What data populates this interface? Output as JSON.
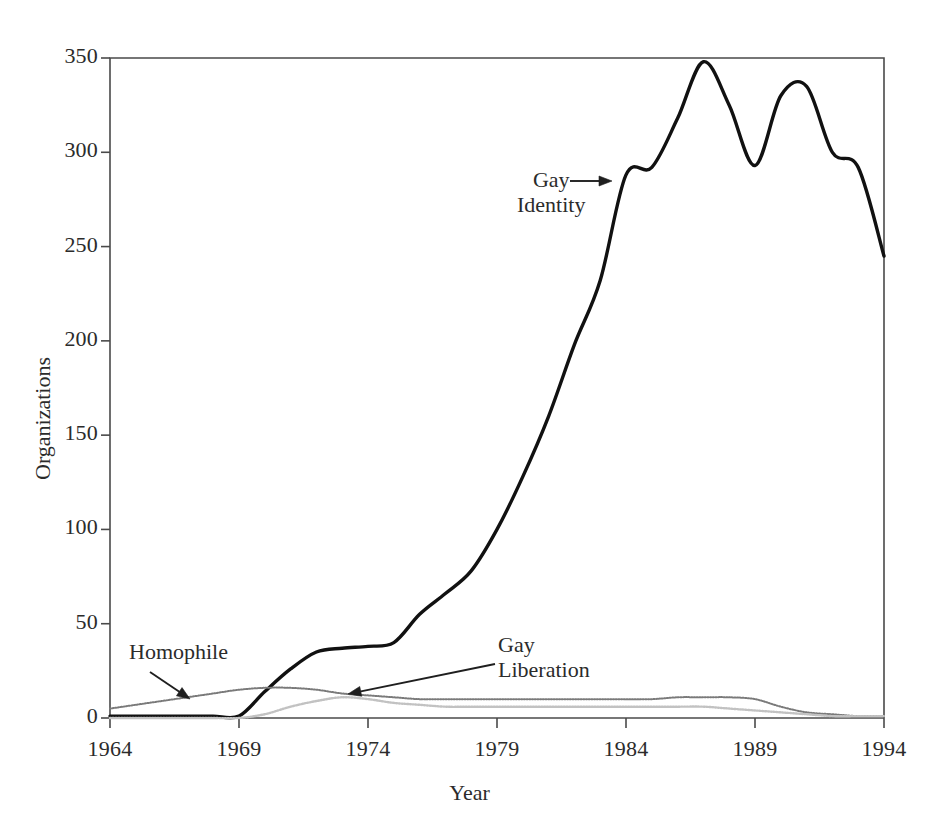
{
  "chart_data": {
    "type": "line",
    "title": "",
    "subtitle": "",
    "xlabel": "Year",
    "ylabel": "Organizations",
    "xlim": [
      1964,
      1994
    ],
    "ylim": [
      0,
      350
    ],
    "xticks": [
      "1964",
      "1969",
      "1974",
      "1979",
      "1984",
      "1989",
      "1994"
    ],
    "xtick_values": [
      1964,
      1969,
      1974,
      1979,
      1984,
      1989,
      1994
    ],
    "yticks": [
      "0",
      "50",
      "100",
      "150",
      "200",
      "250",
      "300",
      "350"
    ],
    "ytick_values": [
      0,
      50,
      100,
      150,
      200,
      250,
      300,
      350
    ],
    "grid": false,
    "legend": "none",
    "legend_position": "inline-annotations",
    "x": [
      1964,
      1965,
      1966,
      1967,
      1968,
      1969,
      1970,
      1971,
      1972,
      1973,
      1974,
      1975,
      1976,
      1977,
      1978,
      1979,
      1980,
      1981,
      1982,
      1983,
      1984,
      1985,
      1986,
      1987,
      1988,
      1989,
      1990,
      1991,
      1992,
      1993,
      1994
    ],
    "series": [
      {
        "name": "Gay Identity",
        "color": "#111111",
        "style": "solid-thick",
        "values": [
          1,
          1,
          1,
          1,
          1,
          1,
          14,
          26,
          35,
          37,
          38,
          40,
          55,
          66,
          78,
          100,
          128,
          160,
          198,
          232,
          288,
          292,
          318,
          348,
          325,
          293,
          330,
          335,
          300,
          292,
          245
        ]
      },
      {
        "name": "Homophile",
        "color": "#7a7a7a",
        "style": "dotted-medium",
        "values": [
          5,
          7,
          9,
          11,
          13,
          15,
          16,
          16,
          15,
          13,
          12,
          11,
          10,
          10,
          10,
          10,
          10,
          10,
          10,
          10,
          10,
          10,
          11,
          11,
          11,
          10,
          6,
          3,
          2,
          1,
          1
        ]
      },
      {
        "name": "Gay Liberation",
        "color": "#c2c2c2",
        "style": "dotted-light",
        "values": [
          0,
          0,
          0,
          0,
          0,
          0,
          2,
          6,
          9,
          11,
          10,
          8,
          7,
          6,
          6,
          6,
          6,
          6,
          6,
          6,
          6,
          6,
          6,
          6,
          5,
          4,
          3,
          2,
          1,
          1,
          1
        ]
      }
    ],
    "annotations": [
      {
        "id": "gay-identity",
        "text": "Gay\nIdentity",
        "lines": [
          "Gay",
          "Identity"
        ],
        "arrow": "right",
        "label_x": 517,
        "label_y": 168,
        "arrow_from": [
          570,
          181
        ],
        "arrow_to": [
          612,
          181
        ]
      },
      {
        "id": "homophile",
        "text": "Homophile",
        "lines": [
          "Homophile"
        ],
        "arrow": "down-right",
        "label_x": 129,
        "label_y": 640,
        "arrow_from": [
          150,
          672
        ],
        "arrow_to": [
          190,
          699
        ]
      },
      {
        "id": "gay-liberation",
        "text": "Gay\nLiberation",
        "lines": [
          "Gay",
          "Liberation"
        ],
        "arrow": "left",
        "label_x": 498,
        "label_y": 633,
        "arrow_from": [
          495,
          664
        ],
        "arrow_to": [
          348,
          694
        ]
      }
    ]
  }
}
